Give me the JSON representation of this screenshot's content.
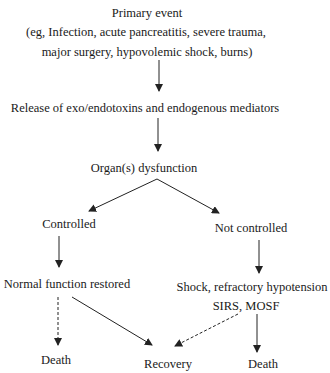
{
  "diagram": {
    "type": "flowchart",
    "nodes": {
      "primary_event": {
        "title": "Primary event",
        "line2": "(eg, Infection, acute pancreatitis, severe trauma,",
        "line3": "major surgery, hypovolemic shock, burns)"
      },
      "release": "Release of exo/endotoxins and endogenous mediators",
      "organ_dysfunction": "Organ(s) dysfunction",
      "controlled": "Controlled",
      "not_controlled": "Not controlled",
      "normal_function": "Normal function restored",
      "shock": {
        "line1": "Shock, refractory hypotension",
        "line2": "SIRS, MOSF"
      },
      "death_left": "Death",
      "recovery": "Recovery",
      "death_right": "Death"
    },
    "edges": [
      {
        "from": "primary_event",
        "to": "release",
        "style": "solid"
      },
      {
        "from": "release",
        "to": "organ_dysfunction",
        "style": "solid"
      },
      {
        "from": "organ_dysfunction",
        "to": "controlled",
        "style": "solid"
      },
      {
        "from": "organ_dysfunction",
        "to": "not_controlled",
        "style": "solid"
      },
      {
        "from": "controlled",
        "to": "normal_function",
        "style": "solid"
      },
      {
        "from": "not_controlled",
        "to": "shock",
        "style": "solid"
      },
      {
        "from": "normal_function",
        "to": "death_left",
        "style": "dashed"
      },
      {
        "from": "normal_function",
        "to": "recovery",
        "style": "solid"
      },
      {
        "from": "shock",
        "to": "recovery",
        "style": "dashed"
      },
      {
        "from": "shock",
        "to": "death_right",
        "style": "solid"
      }
    ],
    "colors": {
      "text": "#1a1a1a",
      "lines": "#222222",
      "background": "#ffffff"
    }
  }
}
